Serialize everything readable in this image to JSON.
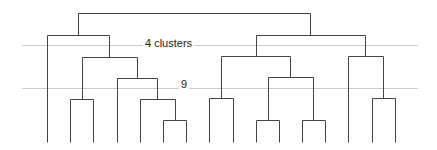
{
  "diagram": {
    "type": "dendrogram",
    "cut_lines": [
      {
        "label": "4 clusters",
        "y": 45,
        "x1": 22,
        "x2": 417,
        "label_x": 143,
        "label_y": 37
      },
      {
        "label": "9",
        "y": 88,
        "x1": 22,
        "x2": 417,
        "label_x": 179,
        "label_y": 78
      }
    ],
    "leaves_x": [
      47,
      70,
      93,
      117,
      140,
      163,
      186,
      209,
      233,
      256,
      279,
      302,
      325,
      348,
      372,
      395
    ],
    "leaf_bottom_y": 142,
    "merges": [
      {
        "id": "a",
        "x1": 70,
        "x2": 93,
        "y": 99
      },
      {
        "id": "b",
        "x1": 163,
        "x2": 186,
        "y": 120
      },
      {
        "id": "c",
        "x1": 140,
        "x2": 175,
        "y": 99
      },
      {
        "id": "d",
        "x1": 117,
        "x2": 157,
        "y": 78
      },
      {
        "id": "e",
        "x1": 82,
        "x2": 137,
        "y": 57
      },
      {
        "id": "f",
        "x1": 47,
        "x2": 109,
        "y": 35
      },
      {
        "id": "g",
        "x1": 209,
        "x2": 233,
        "y": 98
      },
      {
        "id": "h",
        "x1": 256,
        "x2": 279,
        "y": 120
      },
      {
        "id": "i",
        "x1": 302,
        "x2": 325,
        "y": 120
      },
      {
        "id": "j",
        "x1": 268,
        "x2": 313,
        "y": 77
      },
      {
        "id": "k",
        "x1": 221,
        "x2": 290,
        "y": 56
      },
      {
        "id": "l",
        "x1": 372,
        "x2": 395,
        "y": 98
      },
      {
        "id": "m",
        "x1": 348,
        "x2": 383,
        "y": 56
      },
      {
        "id": "n",
        "x1": 256,
        "x2": 365,
        "y": 35
      },
      {
        "id": "root",
        "x1": 78,
        "x2": 310,
        "y": 13
      }
    ],
    "verticals": [
      [
        47,
        35,
        142
      ],
      [
        70,
        99,
        142
      ],
      [
        93,
        99,
        142
      ],
      [
        117,
        78,
        142
      ],
      [
        140,
        99,
        142
      ],
      [
        163,
        120,
        142
      ],
      [
        186,
        120,
        142
      ],
      [
        209,
        98,
        142
      ],
      [
        233,
        98,
        142
      ],
      [
        256,
        120,
        142
      ],
      [
        279,
        120,
        142
      ],
      [
        302,
        120,
        142
      ],
      [
        325,
        120,
        142
      ],
      [
        348,
        56,
        142
      ],
      [
        372,
        98,
        142
      ],
      [
        395,
        98,
        142
      ],
      [
        82,
        57,
        99
      ],
      [
        175,
        99,
        120
      ],
      [
        157,
        78,
        99
      ],
      [
        137,
        57,
        78
      ],
      [
        109,
        35,
        57
      ],
      [
        78,
        13,
        35
      ],
      [
        221,
        56,
        98
      ],
      [
        268,
        77,
        120
      ],
      [
        313,
        77,
        120
      ],
      [
        290,
        56,
        77
      ],
      [
        383,
        56,
        98
      ],
      [
        256,
        35,
        56
      ],
      [
        365,
        35,
        56
      ],
      [
        310,
        13,
        35
      ]
    ],
    "line_color": "#444444",
    "cut_line_color": "#999999"
  }
}
